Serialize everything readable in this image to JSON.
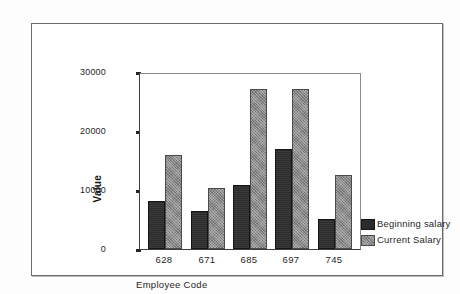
{
  "chart_data": {
    "type": "bar",
    "title": "",
    "xlabel": "Employee Code",
    "ylabel": "Value",
    "categories": [
      "628",
      "671",
      "685",
      "697",
      "745"
    ],
    "series": [
      {
        "name": "Beginning salary",
        "color": "#2b2b2b",
        "values": [
          8200,
          6450,
          10850,
          16950,
          5100
        ]
      },
      {
        "name": "Current Salary",
        "color": "#8a8a8a",
        "values": [
          16000,
          10300,
          27100,
          27200,
          12550
        ]
      }
    ],
    "ylim": [
      0,
      30000
    ],
    "yticks": [
      0,
      10000,
      20000,
      30000
    ],
    "ytick_labels": [
      "0",
      "10000",
      "20000",
      "30000"
    ],
    "grid": false,
    "legend_position": "right"
  },
  "legend": {
    "entries": [
      {
        "label": "Beginning salary"
      },
      {
        "label": "Current Salary"
      }
    ]
  }
}
